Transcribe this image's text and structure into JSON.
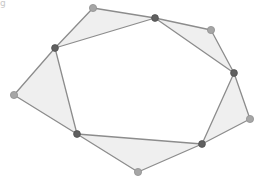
{
  "figure": {
    "corner_glyph": "g",
    "colors": {
      "background": "#ffffff",
      "triangle_fill": "#efefef",
      "edge_stroke": "#8c8c8c",
      "outer_point_fill": "#a6a6a6",
      "outer_point_stroke": "#909090",
      "inner_point_fill": "#606060",
      "inner_point_stroke": "#505050"
    },
    "outer_points": [
      {
        "id": "A",
        "x": 93,
        "y": 8
      },
      {
        "id": "B",
        "x": 211,
        "y": 30
      },
      {
        "id": "C",
        "x": 250,
        "y": 119
      },
      {
        "id": "D",
        "x": 138,
        "y": 172
      },
      {
        "id": "E",
        "x": 14,
        "y": 95
      }
    ],
    "inner_points": [
      {
        "id": "P",
        "x": 155,
        "y": 18
      },
      {
        "id": "Q",
        "x": 234,
        "y": 73
      },
      {
        "id": "R",
        "x": 202,
        "y": 144
      },
      {
        "id": "S",
        "x": 77,
        "y": 134
      },
      {
        "id": "T",
        "x": 55,
        "y": 48
      }
    ],
    "triangles": [
      {
        "name": "triangle-top-left",
        "points": [
          "T",
          "A",
          "P"
        ]
      },
      {
        "name": "triangle-top-right",
        "points": [
          "P",
          "B",
          "Q"
        ]
      },
      {
        "name": "triangle-right",
        "points": [
          "Q",
          "C",
          "R"
        ]
      },
      {
        "name": "triangle-bottom",
        "points": [
          "R",
          "D",
          "S"
        ]
      },
      {
        "name": "triangle-left",
        "points": [
          "S",
          "E",
          "T"
        ]
      }
    ]
  }
}
